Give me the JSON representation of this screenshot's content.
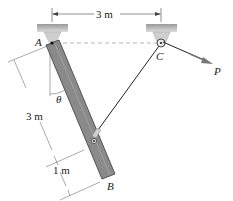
{
  "diagram": {
    "labels": {
      "point_a": "A",
      "point_b": "B",
      "point_c": "C",
      "force_p": "P",
      "angle": "θ"
    },
    "dimensions": {
      "span_ac": "3 m",
      "length_a_to_pin": "3 m",
      "length_pin_to_b": "1 m"
    },
    "colors": {
      "bar": "#8a8a8a",
      "bar_edge": "#3a3a3a",
      "support": "#b8b8b8",
      "cable": "#222222",
      "force_arrow": "#666666"
    }
  }
}
